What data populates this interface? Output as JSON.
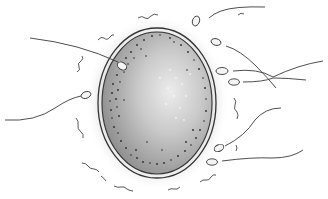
{
  "illustration": {
    "subject": "egg cell surrounded by sperm cells",
    "colors": {
      "background": "#ffffff",
      "line": "#3a3a3a",
      "egg_dark": "#8a8a8a",
      "egg_light": "#e6e6e6",
      "halo": "#d8d8d8"
    },
    "sperm_count": 8
  }
}
